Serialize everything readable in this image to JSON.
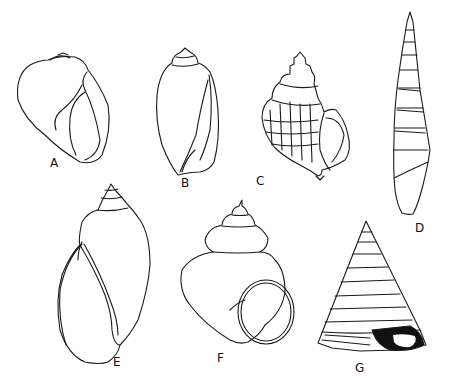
{
  "figure": {
    "background": "#ffffff",
    "ink_color": "#1a1a1a"
  },
  "shells": [
    {
      "id": "A",
      "label": "A",
      "label_pos": [
        50,
        157
      ]
    },
    {
      "id": "B",
      "label": "B",
      "label_pos": [
        181,
        177
      ]
    },
    {
      "id": "C",
      "label": "C",
      "label_pos": [
        256,
        175
      ]
    },
    {
      "id": "D",
      "label": "D",
      "label_pos": [
        415,
        222
      ]
    },
    {
      "id": "E",
      "label": "E",
      "label_pos": [
        113,
        356
      ]
    },
    {
      "id": "F",
      "label": "F",
      "label_pos": [
        217,
        352
      ]
    },
    {
      "id": "G",
      "label": "G",
      "label_pos": [
        355,
        362
      ]
    }
  ]
}
